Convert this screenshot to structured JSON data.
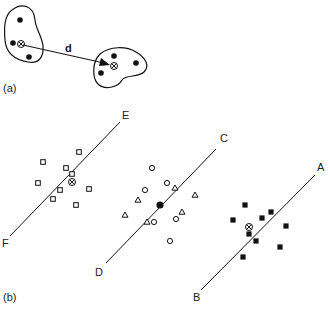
{
  "panel_a": {
    "label": "(a)",
    "distance_label": "d",
    "cluster_left": {
      "points": [
        [
          20,
          20
        ],
        [
          13,
          43
        ],
        [
          29,
          57
        ]
      ],
      "centroid": [
        21,
        44
      ]
    },
    "cluster_right": {
      "points": [
        [
          114,
          56
        ],
        [
          136,
          63
        ],
        [
          101,
          73
        ]
      ],
      "centroid": [
        114,
        66
      ]
    }
  },
  "panel_b": {
    "label": "(b)",
    "lines": [
      {
        "id": "EF",
        "start_label": "F",
        "end_label": "E",
        "start": [
          10,
          236
        ],
        "end": [
          120,
          122
        ]
      },
      {
        "id": "DC",
        "start_label": "D",
        "end_label": "C",
        "start": [
          106,
          263
        ],
        "end": [
          216,
          149
        ]
      },
      {
        "id": "BA",
        "start_label": "B",
        "end_label": "A",
        "start": [
          201,
          290
        ],
        "end": [
          315,
          175
        ]
      }
    ],
    "groups": [
      {
        "marker": "open-square",
        "line": "EF",
        "points": [
          [
            79,
            152
          ],
          [
            43,
            162
          ],
          [
            66,
            168
          ],
          [
            72,
            174
          ],
          [
            38,
            183
          ],
          [
            60,
            190
          ],
          [
            89,
            189
          ],
          [
            53,
            199
          ],
          [
            76,
            205
          ]
        ],
        "centroid": [
          72,
          182
        ],
        "centroid_marker": "circled-x"
      },
      {
        "marker": "open-circle",
        "line": "DC",
        "points": [
          [
            152,
            168
          ],
          [
            167,
            183
          ],
          [
            145,
            190
          ],
          [
            154,
            222
          ],
          [
            176,
            219
          ],
          [
            170,
            241
          ]
        ],
        "centroid": [
          160,
          205
        ],
        "centroid_marker": "filled-circle"
      },
      {
        "marker": "open-triangle",
        "line": "DC",
        "points": [
          [
            175,
            188
          ],
          [
            138,
            200
          ],
          [
            195,
            195
          ],
          [
            125,
            215
          ],
          [
            182,
            212
          ],
          [
            147,
            222
          ]
        ]
      },
      {
        "marker": "filled-square",
        "line": "BA",
        "points": [
          [
            245,
            205
          ],
          [
            233,
            220
          ],
          [
            262,
            218
          ],
          [
            271,
            212
          ],
          [
            286,
            226
          ],
          [
            249,
            234
          ],
          [
            256,
            241
          ],
          [
            280,
            247
          ],
          [
            243,
            257
          ]
        ],
        "centroid": [
          249,
          227
        ],
        "centroid_marker": "circled-x"
      }
    ]
  }
}
